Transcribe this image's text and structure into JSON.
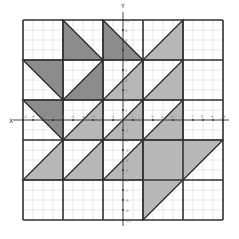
{
  "diagram": {
    "axes": {
      "x_label": "X",
      "y_label": "Y",
      "range": [
        -10,
        10
      ],
      "x_ticks": [
        "-10",
        "-9",
        "-8",
        "-7",
        "-6",
        "-5",
        "-4",
        "-3",
        "-2",
        "-1",
        "1",
        "2",
        "3",
        "4",
        "5",
        "6",
        "7",
        "8",
        "9",
        "10"
      ],
      "y_ticks": [
        "10",
        "9",
        "8",
        "7",
        "6",
        "5",
        "4",
        "3",
        "2",
        "1",
        "-1",
        "-2",
        "-3",
        "-4",
        "-5",
        "-6",
        "-7",
        "-8",
        "-9",
        "-10"
      ]
    },
    "colors": {
      "dark": "#8c8c8c",
      "light": "#b8b8b8",
      "grid_minor": "#d6d6d6",
      "block_border": "#333333",
      "axis": "#333333"
    },
    "blocks": {
      "columns": 5,
      "rows": 5,
      "units_per_block": 4
    },
    "triangles": [
      {
        "name": "r0c1-dark",
        "shade": "dark",
        "points": [
          [
            -6,
            10
          ],
          [
            -6,
            6
          ],
          [
            -2,
            6
          ]
        ]
      },
      {
        "name": "r0c2-dark",
        "shade": "dark",
        "points": [
          [
            -2,
            10
          ],
          [
            -2,
            6
          ],
          [
            2,
            6
          ]
        ]
      },
      {
        "name": "r0c3-light",
        "shade": "light",
        "points": [
          [
            2,
            6
          ],
          [
            6,
            10
          ],
          [
            6,
            6
          ]
        ]
      },
      {
        "name": "r1c0-dark",
        "shade": "dark",
        "points": [
          [
            -10,
            6
          ],
          [
            -6,
            6
          ],
          [
            -6,
            2
          ]
        ]
      },
      {
        "name": "r1c1-dark",
        "shade": "dark",
        "points": [
          [
            -6,
            2
          ],
          [
            -2,
            6
          ],
          [
            -2,
            2
          ]
        ]
      },
      {
        "name": "r1c2-light",
        "shade": "light",
        "points": [
          [
            -2,
            2
          ],
          [
            2,
            6
          ],
          [
            2,
            2
          ]
        ]
      },
      {
        "name": "r1c3-light",
        "shade": "light",
        "points": [
          [
            2,
            2
          ],
          [
            6,
            6
          ],
          [
            6,
            2
          ]
        ]
      },
      {
        "name": "r2c0-dark",
        "shade": "dark",
        "points": [
          [
            -10,
            2
          ],
          [
            -6,
            2
          ],
          [
            -6,
            -2
          ]
        ]
      },
      {
        "name": "r2c1-light",
        "shade": "light",
        "points": [
          [
            -6,
            -2
          ],
          [
            -2,
            2
          ],
          [
            -2,
            -2
          ]
        ]
      },
      {
        "name": "r2c2-light",
        "shade": "light",
        "points": [
          [
            -2,
            -2
          ],
          [
            2,
            2
          ],
          [
            2,
            -2
          ]
        ]
      },
      {
        "name": "r2c3-light",
        "shade": "light",
        "points": [
          [
            2,
            -2
          ],
          [
            6,
            2
          ],
          [
            6,
            -2
          ]
        ]
      },
      {
        "name": "r3c0-light",
        "shade": "light",
        "points": [
          [
            -10,
            -6
          ],
          [
            -6,
            -2
          ],
          [
            -6,
            -6
          ]
        ]
      },
      {
        "name": "r3c1-light",
        "shade": "light",
        "points": [
          [
            -6,
            -6
          ],
          [
            -2,
            -2
          ],
          [
            -2,
            -6
          ]
        ]
      },
      {
        "name": "r3c2-light",
        "shade": "light",
        "points": [
          [
            -2,
            -6
          ],
          [
            2,
            -2
          ],
          [
            2,
            -6
          ]
        ]
      },
      {
        "name": "big-light",
        "shade": "light",
        "points": [
          [
            2,
            -2
          ],
          [
            10,
            -2
          ],
          [
            2,
            -10
          ]
        ]
      }
    ]
  }
}
